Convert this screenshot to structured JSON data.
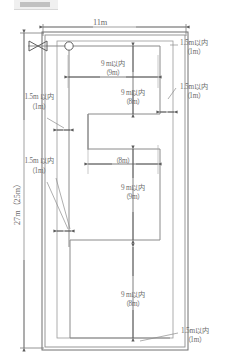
{
  "diagram": {
    "title_strip": "cropped-heading",
    "room_outline": {
      "note": "double-line rectangular room boundary"
    },
    "dimensions": {
      "width_top": "11m",
      "height_left": "27m（25m）"
    },
    "labels": [
      {
        "id": "top-width",
        "text": "11m",
        "sub": ""
      },
      {
        "id": "left-height",
        "text": "27m（25m）",
        "sub": ""
      },
      {
        "id": "branch-1-span",
        "text": "9 m以内",
        "sub": "（9m）"
      },
      {
        "id": "vert-right-upper",
        "text": "9 m以内",
        "sub": "（8m）"
      },
      {
        "id": "branch-2-span",
        "text": "",
        "sub": "（8m）"
      },
      {
        "id": "vert-right-mid",
        "text": "9 m以内",
        "sub": "（9m）"
      },
      {
        "id": "vert-right-lower",
        "text": "9 m以内",
        "sub": "（8m）"
      },
      {
        "id": "clearance-tr",
        "text": "1.5m以内",
        "sub": "（1m）"
      },
      {
        "id": "clearance-r",
        "text": "1.5m以内",
        "sub": "（1m）"
      },
      {
        "id": "clearance-l1",
        "text": "1.5m 以内",
        "sub": "（1m）"
      },
      {
        "id": "clearance-l2",
        "text": "1.5m 以内",
        "sub": "（1m）"
      },
      {
        "id": "clearance-br",
        "text": "1.5m以内",
        "sub": "（1m）"
      }
    ],
    "symbols": [
      {
        "id": "valve",
        "name": "bowtie-valve-symbol"
      },
      {
        "id": "riser",
        "name": "circle-riser-symbol"
      }
    ],
    "colors": {
      "line": "#6f6f6f",
      "pipe": "#8a8a8a",
      "text": "#6d6d6d",
      "wall": "#777777"
    }
  }
}
